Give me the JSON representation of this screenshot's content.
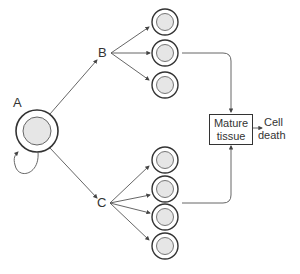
{
  "labels": {
    "a": "A",
    "b": "B",
    "c": "C"
  },
  "box": {
    "line1": "Mature",
    "line2": "tissue"
  },
  "outcome": {
    "line1": "Cell",
    "line2": "death"
  },
  "colors": {
    "stroke": "#333333",
    "cell_fill": "#e6e6e6",
    "line": "#555555"
  }
}
